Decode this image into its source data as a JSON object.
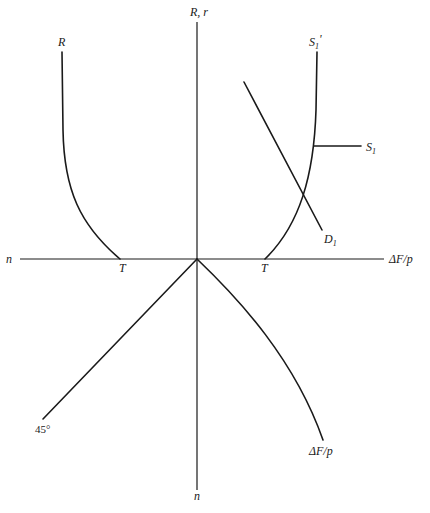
{
  "diagram": {
    "type": "four-quadrant economic diagram",
    "axes": {
      "vertical_top_label": "R, r",
      "vertical_bottom_label": "n",
      "horizontal_left_label": "n",
      "horizontal_right_label": "ΔF/p"
    },
    "curves": {
      "R": {
        "label": "R",
        "end_label": "T"
      },
      "S1_prime": {
        "label_main": "S",
        "label_sub": "1",
        "label_prime": "'",
        "end_label": "T"
      },
      "S1": {
        "label_main": "S",
        "label_sub": "1"
      },
      "D1": {
        "label_main": "D",
        "label_sub": "1"
      },
      "line_45": {
        "label": "45°"
      },
      "deltaF_p": {
        "label": "ΔF/p"
      }
    },
    "colors": {
      "ink": "#1a1a1a",
      "background": "#ffffff"
    }
  }
}
